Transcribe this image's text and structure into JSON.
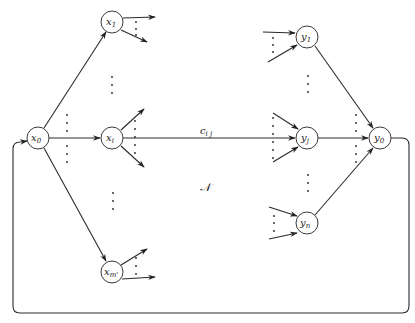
{
  "diagram": {
    "type": "flow-network",
    "nodes": [
      {
        "id": "x0",
        "base": "x",
        "sub": "0",
        "cx": 38,
        "cy": 138
      },
      {
        "id": "x1",
        "base": "x",
        "sub": "1",
        "cx": 112,
        "cy": 22
      },
      {
        "id": "xi",
        "base": "x",
        "sub": "i",
        "cx": 112,
        "cy": 138
      },
      {
        "id": "xm",
        "base": "x",
        "sub": "m'",
        "cx": 112,
        "cy": 272
      },
      {
        "id": "y1",
        "base": "y",
        "sub": "1",
        "cx": 307,
        "cy": 37
      },
      {
        "id": "yj",
        "base": "y",
        "sub": "j",
        "cx": 307,
        "cy": 138
      },
      {
        "id": "yn",
        "base": "y",
        "sub": "n",
        "cx": 307,
        "cy": 223
      },
      {
        "id": "y0",
        "base": "y",
        "sub": "0",
        "cx": 380,
        "cy": 138
      }
    ],
    "edges": [
      {
        "from": "x0",
        "to": "x1"
      },
      {
        "from": "x0",
        "to": "xi"
      },
      {
        "from": "x0",
        "to": "xm"
      },
      {
        "from": "xi",
        "to": "yj",
        "label": "c"
      },
      {
        "from": "y1",
        "to": "y0"
      },
      {
        "from": "yj",
        "to": "y0"
      },
      {
        "from": "yn",
        "to": "y0"
      },
      {
        "from": "y0",
        "to": "x0",
        "kind": "return-loop"
      }
    ],
    "edge_label": {
      "base": "c",
      "sub": "i j"
    },
    "network_label": "𝒩"
  }
}
